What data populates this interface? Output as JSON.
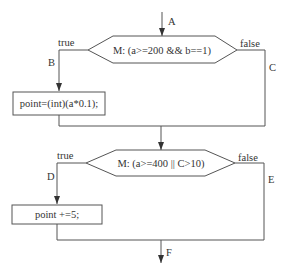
{
  "diagram": {
    "type": "flowchart",
    "entry_label": "A",
    "exit_label": "F",
    "decisions": [
      {
        "id": "decision-1",
        "text": "M: (a>=200 && b==1)",
        "true_label": "true",
        "false_label": "false",
        "true_edge": "B",
        "false_edge": "C"
      },
      {
        "id": "decision-2",
        "text": "M: (a>=400 || C>10)",
        "true_label": "true",
        "false_label": "false",
        "true_edge": "D",
        "false_edge": "E"
      }
    ],
    "processes": [
      {
        "id": "process-1",
        "text": "point=(int)(a*0.1);"
      },
      {
        "id": "process-2",
        "text": "point +=5;"
      }
    ],
    "colors": {
      "stroke": "#555555",
      "text": "#333333",
      "background": "#ffffff"
    }
  }
}
